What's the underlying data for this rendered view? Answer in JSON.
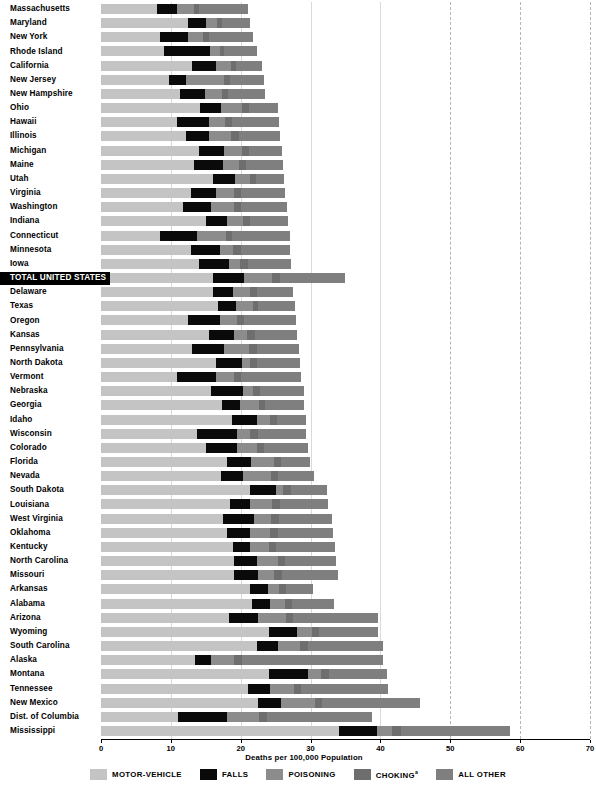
{
  "chart_data": {
    "type": "bar",
    "subtype": "horizontal-stacked",
    "title": "",
    "xlabel": "Deaths per 100,000 Population",
    "ylabel": "",
    "xlim": [
      0,
      70
    ],
    "xticks": [
      0,
      10,
      20,
      30,
      40,
      50,
      60,
      70
    ],
    "grid": "vertical",
    "legend_position": "bottom",
    "series": [
      {
        "name": "MOTOR-VEHICLE",
        "color": "#c4c4c4"
      },
      {
        "name": "FALLS",
        "color": "#0a0a0a"
      },
      {
        "name": "POISONING",
        "color": "#8c8c8c"
      },
      {
        "name": "CHOKING",
        "color": "#6e6e6e",
        "superscript": "a"
      },
      {
        "name": "ALL OTHER",
        "color": "#7f7f7f"
      }
    ],
    "categories": [
      "Massachusetts",
      "Maryland",
      "New York",
      "Rhode Island",
      "California",
      "New Jersey",
      "New Hampshire",
      "Ohio",
      "Hawaii",
      "Illinois",
      "Michigan",
      "Maine",
      "Utah",
      "Virginia",
      "Washington",
      "Indiana",
      "Connecticut",
      "Minnesota",
      "Iowa",
      "TOTAL UNITED STATES",
      "Delaware",
      "Texas",
      "Oregon",
      "Kansas",
      "Pennsylvania",
      "North Dakota",
      "Vermont",
      "Nebraska",
      "Georgia",
      "Idaho",
      "Wisconsin",
      "Colorado",
      "Florida",
      "Nevada",
      "South Dakota",
      "Louisiana",
      "West Virginia",
      "Oklahoma",
      "Kentucky",
      "North Carolina",
      "Missouri",
      "Arkansas",
      "Alabama",
      "Arizona",
      "Wyoming",
      "South Carolina",
      "Alaska",
      "Montana",
      "Tennessee",
      "New Mexico",
      "Dist. of Columbia",
      "Mississippi"
    ],
    "highlight_category": "TOTAL UNITED STATES",
    "values": [
      {
        "state": "Massachusetts",
        "motor_vehicle": 8.0,
        "falls": 2.9,
        "poisoning": 2.4,
        "choking": 0.8,
        "all_other": 6.9,
        "total": 21.0
      },
      {
        "state": "Maryland",
        "motor_vehicle": 12.4,
        "falls": 2.6,
        "poisoning": 1.6,
        "choking": 0.7,
        "all_other": 4.0,
        "total": 21.3
      },
      {
        "state": "New York",
        "motor_vehicle": 8.4,
        "falls": 4.0,
        "poisoning": 2.2,
        "choking": 0.9,
        "all_other": 6.3,
        "total": 21.8
      },
      {
        "state": "Rhode Island",
        "motor_vehicle": 9.0,
        "falls": 6.6,
        "poisoning": 1.4,
        "choking": 0.6,
        "all_other": 4.8,
        "total": 22.4
      },
      {
        "state": "California",
        "motor_vehicle": 13.0,
        "falls": 3.5,
        "poisoning": 2.1,
        "choking": 0.8,
        "all_other": 3.6,
        "total": 23.0
      },
      {
        "state": "New Jersey",
        "motor_vehicle": 9.8,
        "falls": 2.4,
        "poisoning": 5.4,
        "choking": 0.9,
        "all_other": 4.9,
        "total": 23.4
      },
      {
        "state": "New Hampshire",
        "motor_vehicle": 11.3,
        "falls": 3.6,
        "poisoning": 2.4,
        "choking": 0.9,
        "all_other": 5.3,
        "total": 23.5
      },
      {
        "state": "Ohio",
        "motor_vehicle": 14.2,
        "falls": 3.0,
        "poisoning": 3.0,
        "choking": 1.0,
        "all_other": 4.1,
        "total": 25.3
      },
      {
        "state": "Hawaii",
        "motor_vehicle": 10.9,
        "falls": 4.6,
        "poisoning": 2.3,
        "choking": 1.0,
        "all_other": 6.7,
        "total": 25.5
      },
      {
        "state": "Illinois",
        "motor_vehicle": 12.2,
        "falls": 3.3,
        "poisoning": 3.1,
        "choking": 1.1,
        "all_other": 5.9,
        "total": 25.6
      },
      {
        "state": "Michigan",
        "motor_vehicle": 14.1,
        "falls": 3.5,
        "poisoning": 2.6,
        "choking": 1.0,
        "all_other": 4.7,
        "total": 25.9
      },
      {
        "state": "Maine",
        "motor_vehicle": 13.3,
        "falls": 4.1,
        "poisoning": 2.3,
        "choking": 1.0,
        "all_other": 5.3,
        "total": 26.0
      },
      {
        "state": "Utah",
        "motor_vehicle": 16.0,
        "falls": 3.2,
        "poisoning": 2.2,
        "choking": 0.8,
        "all_other": 4.0,
        "total": 26.2
      },
      {
        "state": "Virginia",
        "motor_vehicle": 12.9,
        "falls": 3.5,
        "poisoning": 2.7,
        "choking": 0.9,
        "all_other": 6.3,
        "total": 26.3
      },
      {
        "state": "Washington",
        "motor_vehicle": 11.7,
        "falls": 4.1,
        "poisoning": 3.3,
        "choking": 1.0,
        "all_other": 6.5,
        "total": 26.6
      },
      {
        "state": "Indiana",
        "motor_vehicle": 15.0,
        "falls": 3.1,
        "poisoning": 2.2,
        "choking": 1.0,
        "all_other": 5.5,
        "total": 26.8
      },
      {
        "state": "Connecticut",
        "motor_vehicle": 8.4,
        "falls": 5.3,
        "poisoning": 4.2,
        "choking": 0.9,
        "all_other": 8.2,
        "total": 27.0
      },
      {
        "state": "Minnesota",
        "motor_vehicle": 12.9,
        "falls": 4.2,
        "poisoning": 1.8,
        "choking": 1.1,
        "all_other": 7.1,
        "total": 27.1
      },
      {
        "state": "Iowa",
        "motor_vehicle": 14.1,
        "falls": 4.2,
        "poisoning": 1.6,
        "choking": 1.1,
        "all_other": 6.2,
        "total": 27.2
      },
      {
        "state": "TOTAL UNITED STATES",
        "motor_vehicle": 16.0,
        "falls": 4.5,
        "poisoning": 4.0,
        "choking": 1.1,
        "all_other": 9.4,
        "total": 35.0
      },
      {
        "state": "Delaware",
        "motor_vehicle": 16.0,
        "falls": 2.9,
        "poisoning": 2.5,
        "choking": 0.9,
        "all_other": 5.2,
        "total": 27.5
      },
      {
        "state": "Texas",
        "motor_vehicle": 16.7,
        "falls": 2.6,
        "poisoning": 2.4,
        "choking": 0.8,
        "all_other": 5.3,
        "total": 27.8
      },
      {
        "state": "Oregon",
        "motor_vehicle": 12.5,
        "falls": 4.5,
        "poisoning": 2.5,
        "choking": 1.0,
        "all_other": 7.4,
        "total": 27.9
      },
      {
        "state": "Kansas",
        "motor_vehicle": 15.5,
        "falls": 3.6,
        "poisoning": 1.8,
        "choking": 1.1,
        "all_other": 6.1,
        "total": 28.1
      },
      {
        "state": "Pennsylvania",
        "motor_vehicle": 13.0,
        "falls": 4.6,
        "poisoning": 3.6,
        "choking": 1.1,
        "all_other": 6.0,
        "total": 28.3
      },
      {
        "state": "North Dakota",
        "motor_vehicle": 16.5,
        "falls": 3.7,
        "poisoning": 1.2,
        "choking": 1.0,
        "all_other": 6.1,
        "total": 28.5
      },
      {
        "state": "Vermont",
        "motor_vehicle": 10.9,
        "falls": 5.5,
        "poisoning": 2.7,
        "choking": 1.0,
        "all_other": 8.6,
        "total": 28.7
      },
      {
        "state": "Nebraska",
        "motor_vehicle": 15.8,
        "falls": 4.5,
        "poisoning": 1.4,
        "choking": 1.1,
        "all_other": 6.2,
        "total": 29.0
      },
      {
        "state": "Georgia",
        "motor_vehicle": 17.3,
        "falls": 2.6,
        "poisoning": 2.7,
        "choking": 0.9,
        "all_other": 5.6,
        "total": 29.1
      },
      {
        "state": "Idaho",
        "motor_vehicle": 18.7,
        "falls": 3.7,
        "poisoning": 1.8,
        "choking": 1.0,
        "all_other": 4.1,
        "total": 29.3
      },
      {
        "state": "Wisconsin",
        "motor_vehicle": 13.8,
        "falls": 5.6,
        "poisoning": 2.0,
        "choking": 1.1,
        "all_other": 6.9,
        "total": 29.4
      },
      {
        "state": "Colorado",
        "motor_vehicle": 15.0,
        "falls": 4.4,
        "poisoning": 3.0,
        "choking": 0.9,
        "all_other": 6.3,
        "total": 29.6
      },
      {
        "state": "Florida",
        "motor_vehicle": 18.0,
        "falls": 3.5,
        "poisoning": 3.2,
        "choking": 1.0,
        "all_other": 4.2,
        "total": 29.9
      },
      {
        "state": "Nevada",
        "motor_vehicle": 17.2,
        "falls": 3.2,
        "poisoning": 4.0,
        "choking": 0.9,
        "all_other": 5.2,
        "total": 30.5
      },
      {
        "state": "South Dakota",
        "motor_vehicle": 21.3,
        "falls": 3.7,
        "poisoning": 1.1,
        "choking": 1.1,
        "all_other": 5.2,
        "total": 32.4
      },
      {
        "state": "Louisiana",
        "motor_vehicle": 18.5,
        "falls": 2.9,
        "poisoning": 3.1,
        "choking": 1.1,
        "all_other": 6.9,
        "total": 32.5
      },
      {
        "state": "West Virginia",
        "motor_vehicle": 17.4,
        "falls": 4.5,
        "poisoning": 2.4,
        "choking": 1.2,
        "all_other": 7.5,
        "total": 33.0
      },
      {
        "state": "Oklahoma",
        "motor_vehicle": 18.0,
        "falls": 3.3,
        "poisoning": 2.9,
        "choking": 1.1,
        "all_other": 7.9,
        "total": 33.2
      },
      {
        "state": "Kentucky",
        "motor_vehicle": 18.9,
        "falls": 2.4,
        "poisoning": 2.7,
        "choking": 1.0,
        "all_other": 8.5,
        "total": 33.5
      },
      {
        "state": "North Carolina",
        "motor_vehicle": 19.0,
        "falls": 3.3,
        "poisoning": 3.1,
        "choking": 1.0,
        "all_other": 7.3,
        "total": 33.7
      },
      {
        "state": "Missouri",
        "motor_vehicle": 19.1,
        "falls": 3.4,
        "poisoning": 2.3,
        "choking": 1.1,
        "all_other": 8.0,
        "total": 33.9
      },
      {
        "state": "Arkansas",
        "motor_vehicle": 21.3,
        "falls": 2.6,
        "poisoning": 1.6,
        "choking": 1.0,
        "all_other": 3.8,
        "total": 30.3
      },
      {
        "state": "Alabama",
        "motor_vehicle": 21.6,
        "falls": 2.6,
        "poisoning": 2.1,
        "choking": 1.0,
        "all_other": 6.0,
        "total": 33.3
      },
      {
        "state": "Arizona",
        "motor_vehicle": 18.3,
        "falls": 4.2,
        "poisoning": 4.0,
        "choking": 1.0,
        "all_other": 12.2,
        "total": 39.7
      },
      {
        "state": "Wyoming",
        "motor_vehicle": 24.0,
        "falls": 4.0,
        "poisoning": 2.2,
        "choking": 1.0,
        "all_other": 8.5,
        "total": 39.7
      },
      {
        "state": "South Carolina",
        "motor_vehicle": 22.3,
        "falls": 3.0,
        "poisoning": 3.2,
        "choking": 1.1,
        "all_other": 10.8,
        "total": 40.4
      },
      {
        "state": "Alaska",
        "motor_vehicle": 13.5,
        "falls": 2.2,
        "poisoning": 3.3,
        "choking": 1.2,
        "all_other": 20.2,
        "total": 40.4
      },
      {
        "state": "Montana",
        "motor_vehicle": 24.0,
        "falls": 5.6,
        "poisoning": 1.9,
        "choking": 1.1,
        "all_other": 8.4,
        "total": 41.0
      },
      {
        "state": "Tennessee",
        "motor_vehicle": 21.0,
        "falls": 3.2,
        "poisoning": 3.4,
        "choking": 1.1,
        "all_other": 12.4,
        "total": 41.1
      },
      {
        "state": "New Mexico",
        "motor_vehicle": 22.5,
        "falls": 3.2,
        "poisoning": 5.0,
        "choking": 1.0,
        "all_other": 13.9,
        "total": 45.6
      },
      {
        "state": "Dist. of Columbia",
        "motor_vehicle": 11.0,
        "falls": 7.0,
        "poisoning": 4.6,
        "choking": 1.2,
        "all_other": 15.0,
        "total": 38.8
      },
      {
        "state": "Mississippi",
        "motor_vehicle": 34.0,
        "falls": 5.5,
        "poisoning": 2.2,
        "choking": 1.3,
        "all_other": 15.5,
        "total": 58.5
      }
    ]
  }
}
